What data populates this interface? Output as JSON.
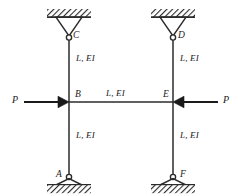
{
  "figure": {
    "type": "structural-frame-diagram",
    "colors": {
      "line": "#2b2b2b",
      "hatch": "#2b2b2b",
      "background": "#ffffff",
      "text": "#1a1a1a"
    }
  },
  "nodes": [
    {
      "id": "C",
      "label": "C",
      "x": 69,
      "y": 38,
      "support": "pin",
      "support_side": "top",
      "label_x": 73,
      "label_y": 31
    },
    {
      "id": "D",
      "label": "D",
      "x": 173,
      "y": 38,
      "support": "pin",
      "support_side": "top",
      "label_x": 178,
      "label_y": 31
    },
    {
      "id": "B",
      "label": "B",
      "x": 69,
      "y": 102,
      "support": "none",
      "support_side": "",
      "label_x": 75,
      "label_y": 90
    },
    {
      "id": "E",
      "label": "E",
      "x": 173,
      "y": 102,
      "support": "none",
      "support_side": "",
      "label_x": 163,
      "label_y": 90
    },
    {
      "id": "A",
      "label": "A",
      "x": 69,
      "y": 178,
      "support": "pin",
      "support_side": "bottom",
      "label_x": 56,
      "label_y": 170
    },
    {
      "id": "F",
      "label": "F",
      "x": 173,
      "y": 178,
      "support": "pin",
      "support_side": "bottom",
      "label_x": 180,
      "label_y": 170
    }
  ],
  "members": [
    {
      "id": "CB",
      "from": "C",
      "to": "B",
      "orientation": "vertical",
      "label": "L, EI",
      "label_x": 76,
      "label_y": 54
    },
    {
      "id": "BA",
      "from": "B",
      "to": "A",
      "orientation": "vertical",
      "label": "L, EI",
      "label_x": 76,
      "label_y": 131
    },
    {
      "id": "DE",
      "from": "D",
      "to": "E",
      "orientation": "vertical",
      "label": "L, EI",
      "label_x": 180,
      "label_y": 54
    },
    {
      "id": "EF",
      "from": "E",
      "to": "F",
      "orientation": "vertical",
      "label": "L, EI",
      "label_x": 180,
      "label_y": 131
    },
    {
      "id": "BE",
      "from": "B",
      "to": "E",
      "orientation": "horizontal",
      "label": "L, EI",
      "label_x": 106,
      "label_y": 89
    }
  ],
  "loads": [
    {
      "id": "P-left",
      "label": "P",
      "direction": "right",
      "applied_at": "B",
      "tail_x": 24,
      "tip_x": 66,
      "y": 102,
      "label_x": 12,
      "label_y": 95
    },
    {
      "id": "P-right",
      "label": "P",
      "direction": "left",
      "applied_at": "E",
      "tail_x": 218,
      "tip_x": 176,
      "y": 102,
      "label_x": 223,
      "label_y": 95
    }
  ],
  "supports": {
    "top_left": {
      "node": "C",
      "hatch_x": 47,
      "hatch_y": 9,
      "hatch_w": 44,
      "hatch_h": 8,
      "tri_half_w": 13,
      "tri_h": 19
    },
    "top_right": {
      "node": "D",
      "hatch_x": 151,
      "hatch_y": 9,
      "hatch_w": 44,
      "hatch_h": 8,
      "tri_half_w": 13,
      "tri_h": 19
    },
    "bottom_left": {
      "node": "A",
      "hatch_x": 47,
      "hatch_y": 185,
      "hatch_w": 44,
      "hatch_h": 8,
      "tri_half_w": 13,
      "tri_h": 19
    },
    "bottom_right": {
      "node": "F",
      "hatch_x": 151,
      "hatch_y": 185,
      "hatch_w": 44,
      "hatch_h": 8,
      "tri_half_w": 13,
      "tri_h": 19
    }
  }
}
